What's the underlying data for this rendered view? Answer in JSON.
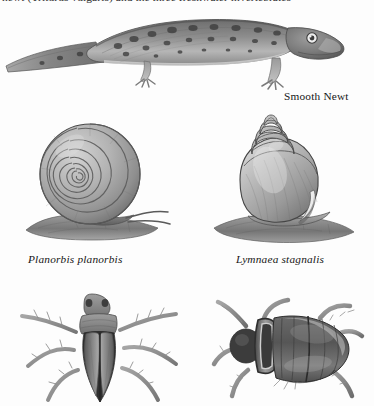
{
  "document": {
    "type": "natural-history-plate",
    "background_color": "#fdfdfd",
    "ink_color": "#1a1a1a",
    "top_text_line": "newt (Triturus vulgaris) and the three freshwater invertebrates"
  },
  "figures": {
    "newt": {
      "caption": "Smooth Newt",
      "caption_style": "roman",
      "subject": "smooth newt lateral view, spotted skin, four legs, long tapering tail"
    },
    "planorbis": {
      "caption": "Planorbis planorbis",
      "caption_style": "italic",
      "subject": "ramshorn snail with flat planispiral coiled shell on a stone"
    },
    "lymnaea": {
      "caption": "Lymnaea stagnalis",
      "caption_style": "italic",
      "subject": "great pond snail with tall conical spired shell on a stone"
    },
    "waterbug": {
      "caption": "",
      "caption_style": "none",
      "subject": "aquatic bug dorsal view with long outstretched swimming legs"
    },
    "beetle": {
      "caption": "",
      "caption_style": "none",
      "subject": "great diving beetle dorsal view with oval elytra and swimming legs"
    }
  }
}
